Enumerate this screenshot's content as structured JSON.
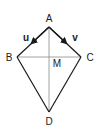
{
  "diagram": {
    "type": "kite",
    "colors": {
      "edge": "#1a1a1a",
      "diagonal": "#8a8a8a",
      "text": "#222222"
    },
    "vertices": [
      {
        "name": "A",
        "label": "A",
        "x": 49,
        "y": 27,
        "lx": 49,
        "ly": 22
      },
      {
        "name": "B",
        "label": "B",
        "x": 17,
        "y": 57,
        "lx": 9,
        "ly": 61
      },
      {
        "name": "C",
        "label": "C",
        "x": 81,
        "y": 57,
        "lx": 90,
        "ly": 61
      },
      {
        "name": "D",
        "label": "D",
        "x": 49,
        "y": 112,
        "lx": 49,
        "ly": 125
      }
    ],
    "midpoint": {
      "label": "M",
      "x": 49,
      "y": 57,
      "lx": 57,
      "ly": 67
    },
    "vectors": [
      {
        "label": "u",
        "from": "A",
        "to": "B",
        "lx": 26,
        "ly": 41
      },
      {
        "label": "v",
        "from": "A",
        "to": "C",
        "lx": 75,
        "ly": 41
      }
    ]
  }
}
